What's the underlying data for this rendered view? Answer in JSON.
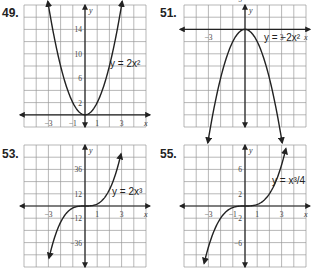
{
  "problems": [
    {
      "number": "49.",
      "equation_label": "y = 2x²"
    },
    {
      "number": "51.",
      "equation_label": "y = −2x²"
    },
    {
      "number": "53.",
      "equation_label": "y = 2x³"
    },
    {
      "number": "55.",
      "equation_label": "y = x³/4"
    }
  ],
  "chart_data": [
    {
      "type": "line",
      "title": "49.",
      "function": "y = 2x^2",
      "xlabel": "x",
      "ylabel": "y",
      "x_tick_labels": [
        "-3",
        "-1",
        "1",
        "3"
      ],
      "y_tick_labels": [
        "2",
        "6",
        "10",
        "14"
      ],
      "xlim": [
        -5,
        5
      ],
      "ylim": [
        -2,
        18
      ],
      "grid": true,
      "x": [
        -3,
        -2,
        -1,
        0,
        1,
        2,
        3
      ],
      "y": [
        18,
        8,
        2,
        0,
        2,
        8,
        18
      ]
    },
    {
      "type": "line",
      "title": "51.",
      "function": "y = -2x^2",
      "xlabel": "x",
      "ylabel": "y",
      "x_tick_labels": [
        "-3",
        "3"
      ],
      "y_tick_labels": [
        "-5",
        "-10",
        "-15"
      ],
      "xlim": [
        -5,
        5
      ],
      "ylim": [
        -16,
        4
      ],
      "grid": true,
      "x": [
        -3,
        -2,
        -1,
        0,
        1,
        2,
        3
      ],
      "y": [
        -18,
        -8,
        -2,
        0,
        -2,
        -8,
        -18
      ]
    },
    {
      "type": "line",
      "title": "53.",
      "function": "y = 2x^3",
      "xlabel": "x",
      "ylabel": "y",
      "x_tick_labels": [
        "-3",
        "1",
        "3"
      ],
      "y_tick_labels": [
        "36",
        "12",
        "-12",
        "-36"
      ],
      "xlim": [
        -5,
        5
      ],
      "ylim": [
        -60,
        60
      ],
      "grid": true,
      "x": [
        -3,
        -2,
        -1,
        0,
        1,
        2,
        3
      ],
      "y": [
        -54,
        -16,
        -2,
        0,
        2,
        16,
        54
      ]
    },
    {
      "type": "line",
      "title": "55.",
      "function": "y = x^3/4",
      "xlabel": "x",
      "ylabel": "y",
      "x_tick_labels": [
        "-3",
        "-1",
        "1",
        "3"
      ],
      "y_tick_labels": [
        "6",
        "2",
        "-2",
        "-6"
      ],
      "xlim": [
        -5,
        5
      ],
      "ylim": [
        -10,
        10
      ],
      "grid": true,
      "x": [
        -3,
        -2,
        -1,
        0,
        1,
        2,
        3
      ],
      "y": [
        -6.75,
        -2,
        -0.25,
        0,
        0.25,
        2,
        6.75
      ]
    }
  ]
}
